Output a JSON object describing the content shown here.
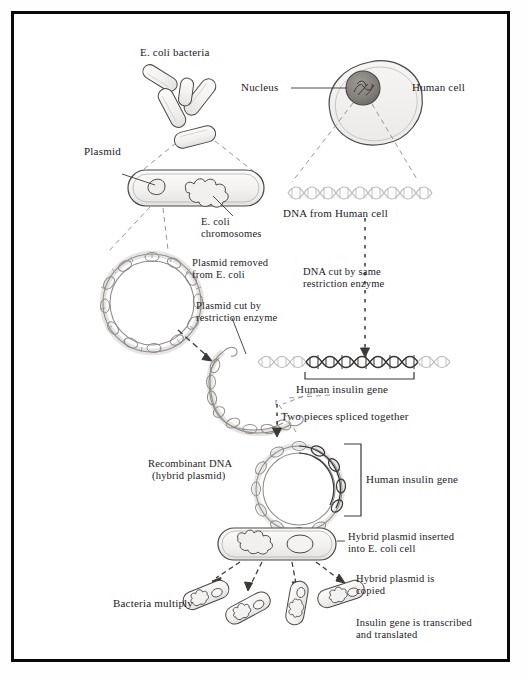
{
  "diagram": {
    "frame_color": "#0a0a0a",
    "background": "#ffffff",
    "ink_color": "#23211f",
    "dna_light_color": "#b9b6b2",
    "dna_dark_color": "#3a3734",
    "labels": {
      "ecoli_bacteria": "E. coli bacteria",
      "nucleus": "Nucleus",
      "human_cell": "Human cell",
      "plasmid": "Plasmid",
      "ecoli_chromosomes_line1": "E. coli",
      "ecoli_chromosomes_line2": "chromosomes",
      "dna_from_human_cell": "DNA from Human cell",
      "plasmid_removed_line1": "Plasmid removed",
      "plasmid_removed_line2": "from E. coli",
      "dna_cut_line1": "DNA cut by same",
      "dna_cut_line2": "restriction enzyme",
      "plasmid_cut_line1": "Plasmid cut by",
      "plasmid_cut_line2": "restriction enzyme",
      "human_insulin_gene_dna": "Human insulin gene",
      "two_pieces_spliced": "Two pieces spliced together",
      "recombinant_dna_line1": "Recombinant DNA",
      "recombinant_dna_line2": "(hybrid plasmid)",
      "human_insulin_gene_plasmid": "Human insulin gene",
      "hybrid_inserted_line1": "Hybrid plasmid inserted",
      "hybrid_inserted_line2": "into E. coli cell",
      "hybrid_copied_line1": "Hybrid plasmid is",
      "hybrid_copied_line2": "copied",
      "bacteria_multiply": "Bacteria multiply",
      "insulin_transcribed_line1": "Insulin gene is transcribed",
      "insulin_transcribed_line2": "and translated"
    },
    "steps": [
      "E. coli bacteria",
      "Plasmid and E. coli chromosomes inside cell",
      "Plasmid removed from E. coli",
      "Plasmid cut by restriction enzyme",
      "Human cell nucleus yields DNA",
      "DNA cut by same restriction enzyme",
      "Human insulin gene isolated",
      "Two pieces spliced together",
      "Recombinant DNA (hybrid plasmid)",
      "Hybrid plasmid inserted into E. coli cell",
      "Bacteria multiply; hybrid plasmid is copied",
      "Insulin gene is transcribed and translated"
    ]
  }
}
